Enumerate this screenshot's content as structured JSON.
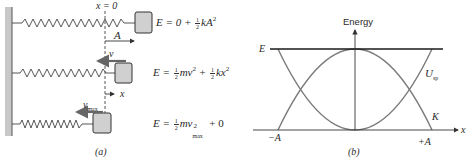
{
  "panel_a": {
    "caption": "(a)",
    "origin_label": "x = 0",
    "amplitude_label": "A",
    "velocity_label": "v",
    "vmax_label": "v",
    "vmax_sub": "max",
    "displacement_label": "x",
    "equations": [
      {
        "lhs": "E = 0 + ",
        "frac": [
          "1",
          "2"
        ],
        "rest": "kA",
        "sup": "2"
      },
      {
        "lhs": "E = ",
        "frac": [
          "1",
          "2"
        ],
        "rest": "mv",
        "sup": "2",
        "mid": " + ",
        "frac2": [
          "1",
          "2"
        ],
        "rest2": "kx",
        "sup2": "2"
      },
      {
        "lhs": "E = ",
        "frac": [
          "1",
          "2"
        ],
        "rest": "mv",
        "sup": "2",
        "sub": "max",
        "tail": " + 0"
      }
    ],
    "colors": {
      "wall": "#c8c8c8",
      "block": "#d0d0d0",
      "spring": "#444444",
      "arrow": "#555555"
    }
  },
  "panel_b": {
    "caption": "(b)",
    "y_axis_label": "Energy",
    "x_axis_label": "x",
    "total_energy_label": "E",
    "potential_label": "U",
    "potential_sub": "sp",
    "kinetic_label": "K",
    "neg_amplitude_label": "−A",
    "pos_amplitude_label": "+A",
    "colors": {
      "curves": "#7a7a7a",
      "energy_line": "#1a1a1a",
      "axes": "#333333"
    }
  }
}
